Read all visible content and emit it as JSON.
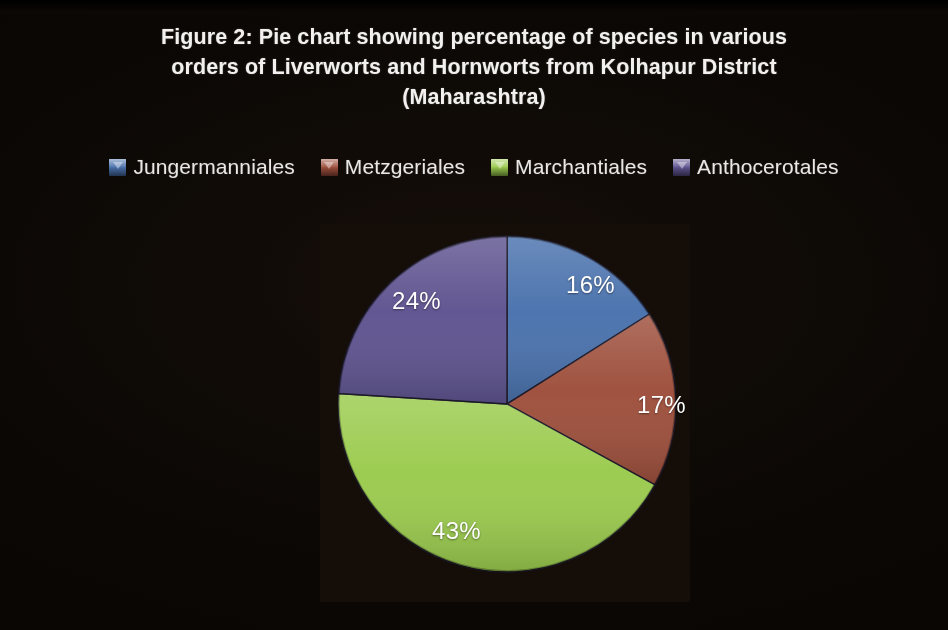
{
  "figure": {
    "title_lines": [
      "Figure 2: Pie chart showing percentage of species in various",
      "orders of Liverworts and Hornworts from Kolhapur District",
      "(Maharashtra)"
    ],
    "title_full": "Figure 2: Pie chart showing percentage of species in various orders of Liverworts and Hornworts from Kolhapur District (Maharashtra)",
    "background_color": "#070503",
    "plot_background_color": "#140d08",
    "title_color": "#f2f1ef",
    "label_color": "#ffffff"
  },
  "legend": {
    "position": "top",
    "items": [
      {
        "label": "Jungermanniales",
        "color": "#4a72ad"
      },
      {
        "label": "Metzgeriales",
        "color": "#9e4f3c"
      },
      {
        "label": "Marchantiales",
        "color": "#9bcb4e"
      },
      {
        "label": "Anthocerotales",
        "color": "#5f5490"
      }
    ]
  },
  "chart_data": {
    "type": "pie",
    "title": "Figure 2: Pie chart showing percentage of species in various orders of Liverworts and Hornworts from Kolhapur District (Maharashtra)",
    "xlabel": "",
    "ylabel": "",
    "legend_position": "top",
    "grid": false,
    "unit": "%",
    "start_angle_deg": 0,
    "direction": "clockwise",
    "categories": [
      "Jungermanniales",
      "Metzgeriales",
      "Marchantiales",
      "Anthocerotales"
    ],
    "values": [
      16,
      17,
      43,
      24
    ],
    "colors": [
      "#4a72ad",
      "#9e4f3c",
      "#9bcb4e",
      "#5f5490"
    ],
    "data_labels": [
      "16%",
      "17%",
      "43%",
      "24%"
    ],
    "slices": [
      {
        "name": "Jungermanniales",
        "value": 16,
        "label": "16%",
        "color": "#4a72ad"
      },
      {
        "name": "Metzgeriales",
        "value": 17,
        "label": "17%",
        "color": "#9e4f3c"
      },
      {
        "name": "Marchantiales",
        "value": 43,
        "label": "43%",
        "color": "#9bcb4e"
      },
      {
        "name": "Anthocerotales",
        "value": 24,
        "label": "24%",
        "color": "#5f5490"
      }
    ]
  }
}
